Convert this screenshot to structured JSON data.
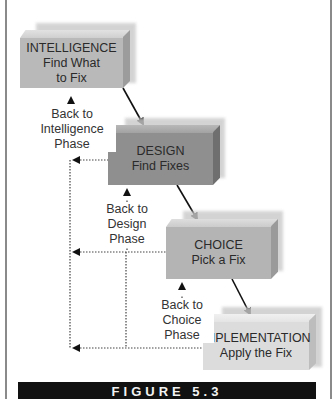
{
  "figure": {
    "caption": "FIGURE 5.3"
  },
  "phases": [
    {
      "title": "INTELLIGENCE",
      "subtitle_line1": "Find What",
      "subtitle_line2": "to Fix",
      "color": "#b9b9b9"
    },
    {
      "title": "DESIGN",
      "subtitle_line1": "Find Fixes",
      "color": "#8f8f8f"
    },
    {
      "title": "CHOICE",
      "subtitle_line1": "Pick a Fix",
      "color": "#b4b4b4"
    },
    {
      "title": "IMPLEMENTATION",
      "subtitle_line1": "Apply the Fix",
      "color": "#dcdcdc"
    }
  ],
  "feedback_labels": [
    {
      "line1": "Back to",
      "line2": "Intelligence",
      "line3": "Phase"
    },
    {
      "line1": "Back to",
      "line2": "Design",
      "line3": "Phase"
    },
    {
      "line1": "Back to",
      "line2": "Choice",
      "line3": "Phase"
    }
  ]
}
